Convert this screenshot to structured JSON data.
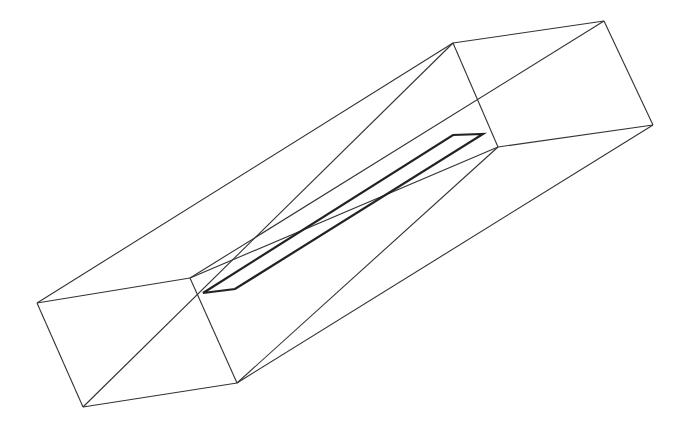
{
  "diagram": {
    "type": "wireframe-3d-box-with-slot",
    "stroke_color": "#333333",
    "slot_stroke_color": "#222222",
    "background": "#ffffff",
    "box": {
      "front_face": [
        [
          37,
          303
        ],
        [
          190,
          278
        ],
        [
          237,
          383
        ],
        [
          83,
          407
        ]
      ],
      "back_face": [
        [
          453,
          43
        ],
        [
          604,
          21
        ],
        [
          653,
          125
        ],
        [
          498,
          147
        ]
      ],
      "front_diagonal": [
        [
          83,
          407
        ],
        [
          190,
          278
        ]
      ],
      "back_diagonal": [
        [
          453,
          43
        ],
        [
          604,
          21
        ]
      ]
    },
    "slot": [
      [
        203,
        293
      ],
      [
        235,
        289
      ],
      [
        483,
        134
      ],
      [
        453,
        135
      ]
    ]
  }
}
